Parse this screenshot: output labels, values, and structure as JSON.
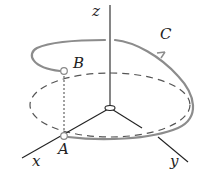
{
  "diagram": {
    "labels": {
      "z_axis": "z",
      "x_axis": "x",
      "y_axis": "y",
      "curve": "C",
      "point_a": "A",
      "point_b": "B"
    },
    "colors": {
      "axes": "#222222",
      "curve": "#8c8c8c",
      "dashed_circle": "#555555"
    }
  }
}
